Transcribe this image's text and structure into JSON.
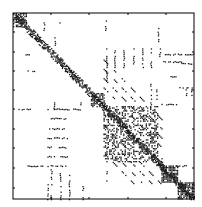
{
  "chart_data": {
    "type": "heatmap",
    "subtype": "sparsity-pattern (spy plot)",
    "title": "",
    "xlabel": "",
    "ylabel": "",
    "tick_labels_visible": false,
    "grid": false,
    "legend": null,
    "colors": {
      "frame": "#000000",
      "marker": "#1a1a1a",
      "background": "#ffffff"
    },
    "frame_px": {
      "left": 13,
      "top": 13,
      "right": 194,
      "bottom": 199
    },
    "y_ticks_px": [
      32,
      52,
      71,
      90,
      109,
      129,
      148,
      168,
      188
    ],
    "x_ticks_px": [
      51,
      89,
      128,
      166
    ],
    "matrix_size_normalized": 1.0,
    "structure": {
      "diagonal_band": {
        "from": 0.0,
        "to": 1.0,
        "halfwidth": 0.025,
        "density": 0.75
      },
      "dense_blocks": [
        {
          "x0": 0.0,
          "y0": 0.0,
          "x1": 0.07,
          "y1": 0.07,
          "density": 0.55
        },
        {
          "x0": 0.43,
          "y0": 0.43,
          "x1": 0.5,
          "y1": 0.5,
          "density": 0.6
        },
        {
          "x0": 0.5,
          "y0": 0.5,
          "x1": 0.8,
          "y1": 0.8,
          "density": 0.35
        },
        {
          "x0": 0.82,
          "y0": 0.82,
          "x1": 0.91,
          "y1": 0.91,
          "density": 0.75
        },
        {
          "x0": 0.91,
          "y0": 0.91,
          "x1": 1.0,
          "y1": 1.0,
          "density": 0.8
        }
      ],
      "dash_rows": [
        {
          "y": 0.515,
          "x0": 0.19,
          "x1": 0.37
        },
        {
          "y": 0.565,
          "x0": 0.19,
          "x1": 0.3
        },
        {
          "y": 0.62,
          "x0": 0.19,
          "x1": 0.3
        },
        {
          "y": 0.67,
          "x0": 0.19,
          "x1": 0.3
        },
        {
          "y": 0.72,
          "x0": 0.19,
          "x1": 0.3
        },
        {
          "y": 0.77,
          "x0": 0.19,
          "x1": 0.3
        },
        {
          "y": 0.82,
          "x0": 0.19,
          "x1": 0.3
        },
        {
          "y": 0.515,
          "x0": 0.03,
          "x1": 0.1
        },
        {
          "y": 0.82,
          "x0": 0.08,
          "x1": 0.19
        },
        {
          "y": 0.31,
          "x0": 0.08,
          "x1": 0.12
        },
        {
          "y": 0.22,
          "x0": 0.06,
          "x1": 0.09
        },
        {
          "y": 0.22,
          "x0": 0.83,
          "x1": 0.93
        },
        {
          "y": 0.26,
          "x0": 0.83,
          "x1": 0.93
        },
        {
          "y": 0.34,
          "x0": 0.87,
          "x1": 0.92
        },
        {
          "y": 0.4,
          "x0": 0.91,
          "x1": 0.97
        },
        {
          "y": 0.49,
          "x0": 0.82,
          "x1": 0.9
        },
        {
          "y": 0.82,
          "x0": 0.9,
          "x1": 0.97
        },
        {
          "y": 0.27,
          "x0": 0.93,
          "x1": 1.0
        },
        {
          "y": 0.22,
          "x0": 0.95,
          "x1": 1.0
        }
      ],
      "dot_columns": [
        {
          "x": 0.515,
          "y0": 0.19,
          "y1": 0.3
        },
        {
          "x": 0.56,
          "y0": 0.19,
          "y1": 0.3
        },
        {
          "x": 0.61,
          "y0": 0.19,
          "y1": 0.3
        },
        {
          "x": 0.665,
          "y0": 0.19,
          "y1": 0.3
        },
        {
          "x": 0.715,
          "y0": 0.19,
          "y1": 0.3
        },
        {
          "x": 0.76,
          "y0": 0.19,
          "y1": 0.3
        },
        {
          "x": 0.81,
          "y0": 0.19,
          "y1": 0.25
        },
        {
          "x": 0.515,
          "y0": 0.85,
          "y1": 0.91
        },
        {
          "x": 0.21,
          "y0": 0.84,
          "y1": 0.92
        },
        {
          "x": 0.26,
          "y0": 0.84,
          "y1": 0.92
        },
        {
          "x": 0.31,
          "y0": 0.84,
          "y1": 0.92
        },
        {
          "x": 0.19,
          "y0": 0.92,
          "y1": 1.0
        },
        {
          "x": 0.21,
          "y0": 0.92,
          "y1": 1.0
        },
        {
          "x": 0.26,
          "y0": 0.92,
          "y1": 1.0
        },
        {
          "x": 0.31,
          "y0": 0.92,
          "y1": 1.0
        },
        {
          "x": 0.385,
          "y0": 0.92,
          "y1": 1.0
        },
        {
          "x": 0.76,
          "y0": 0.38,
          "y1": 0.5
        },
        {
          "x": 0.79,
          "y0": 0.4,
          "y1": 0.48
        },
        {
          "x": 0.955,
          "y0": 0.4,
          "y1": 0.45
        },
        {
          "x": 0.985,
          "y0": 0.4,
          "y1": 0.45
        },
        {
          "x": 0.515,
          "y0": 0.3,
          "y1": 0.38
        },
        {
          "x": 0.82,
          "y0": 0.78,
          "y1": 0.86
        },
        {
          "x": 0.255,
          "y0": 0.05,
          "y1": 0.06
        },
        {
          "x": 0.17,
          "y0": 0.04,
          "y1": 0.09
        },
        {
          "x": 0.23,
          "y0": 0.13,
          "y1": 0.18
        },
        {
          "x": 0.51,
          "y0": 0.03,
          "y1": 0.09
        },
        {
          "x": 0.8,
          "y0": 0.07,
          "y1": 0.15
        },
        {
          "x": 0.225,
          "y0": 0.48,
          "y1": 0.51
        },
        {
          "x": 0.37,
          "y0": 0.48,
          "y1": 0.51
        }
      ],
      "diagonal_stripes": {
        "region": {
          "x0": 0.5,
          "y0": 0.5,
          "x1": 0.82,
          "y1": 0.82
        },
        "offsets": [
          -0.25,
          -0.2,
          -0.15,
          -0.1,
          0.1,
          0.15,
          0.2,
          0.25
        ],
        "step": 0.05
      }
    }
  }
}
